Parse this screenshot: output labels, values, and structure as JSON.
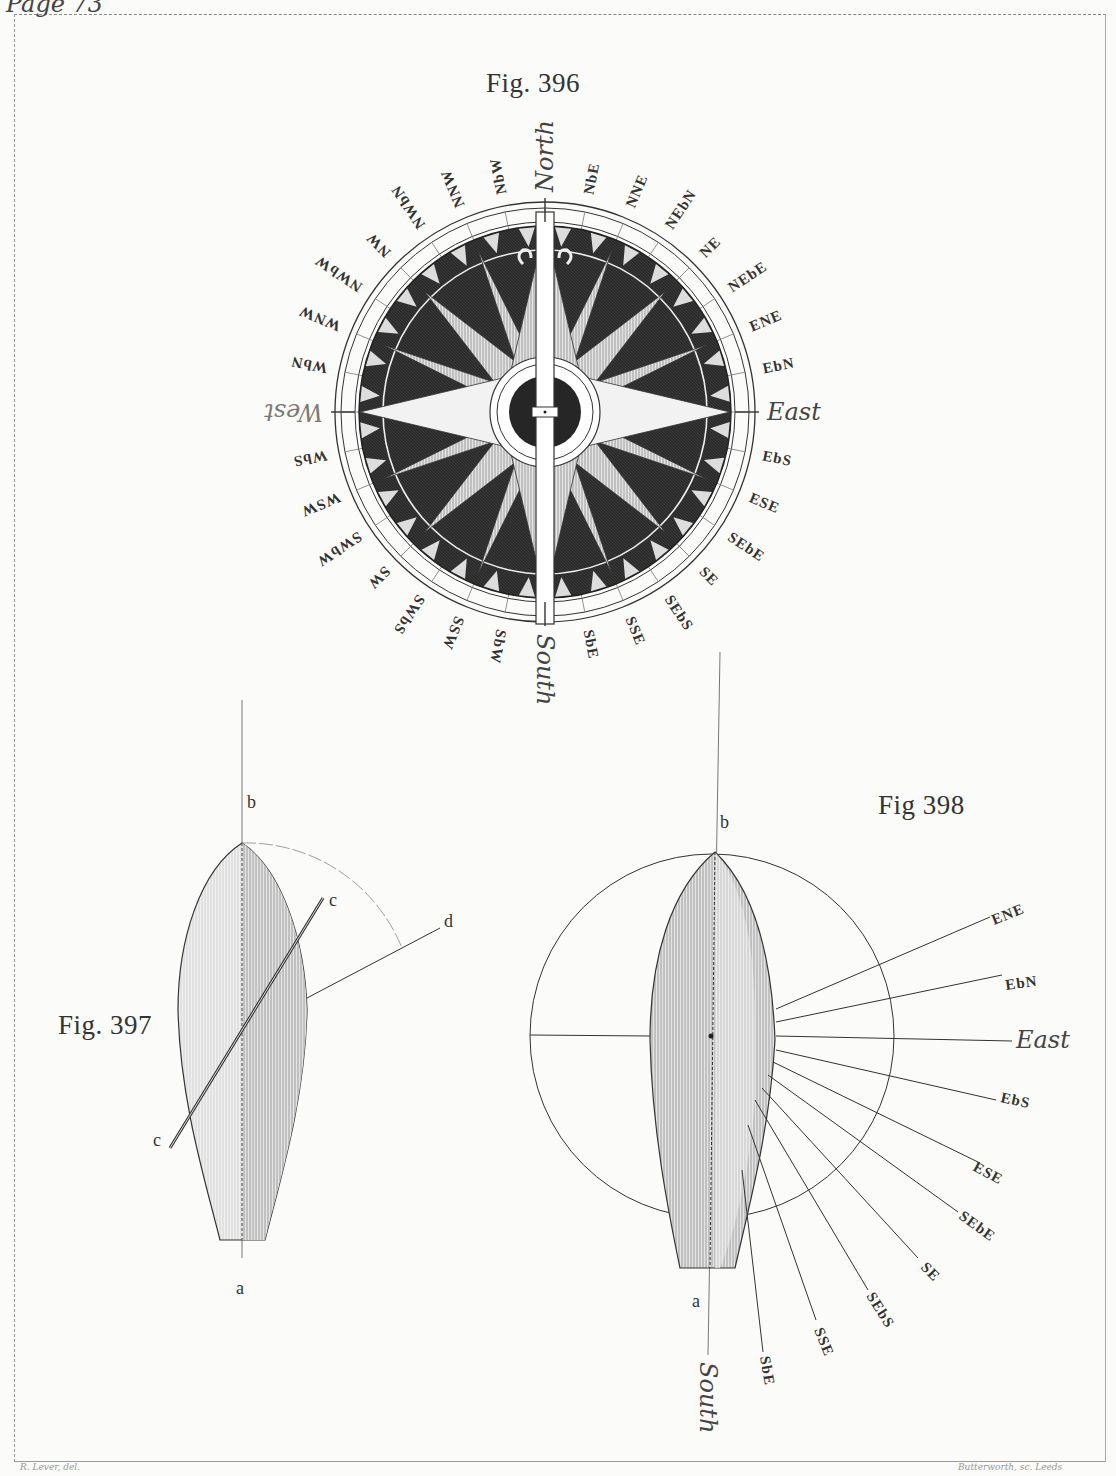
{
  "page": {
    "header_note": "Page 73",
    "credit_left": "R. Lever, del.",
    "credit_right": "Butterworth, sc. Leeds"
  },
  "fig396": {
    "title": "Fig. 396",
    "cardinals": {
      "north": "North",
      "east": "East",
      "south": "South",
      "west": "West"
    },
    "points": [
      "NbE",
      "NNE",
      "NEbN",
      "NE",
      "NEbE",
      "ENE",
      "EbN",
      "EbS",
      "ESE",
      "SEbE",
      "SE",
      "SEbS",
      "SSE",
      "SbE",
      "SbW",
      "SSW",
      "SWbS",
      "SW",
      "SWbW",
      "WSW",
      "WbS",
      "WbN",
      "WNW",
      "NWbW",
      "NW",
      "NWbN",
      "NNW",
      "NbW"
    ]
  },
  "fig397": {
    "title": "Fig. 397",
    "labels": {
      "a": "a",
      "b": "b",
      "c_top": "c",
      "c_bottom": "c",
      "d": "d"
    }
  },
  "fig398": {
    "title": "Fig 398",
    "labels": {
      "a": "a",
      "b": "b"
    },
    "rays": [
      "ENE",
      "EbN",
      "East",
      "EbS",
      "ESE",
      "SEbE",
      "SE",
      "SEbS",
      "SSE",
      "SbE"
    ],
    "south": "South"
  },
  "colors": {
    "ink": "#2a2a2a",
    "paper": "#fbfbf9",
    "dial": "#2b2b2b",
    "hull": "#c8c8c8"
  }
}
